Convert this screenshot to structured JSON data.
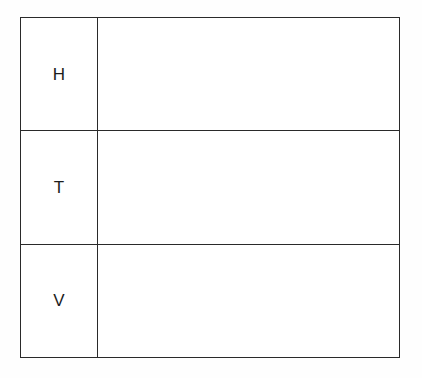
{
  "page": {
    "background_color": "#fefefe",
    "border_color": "#2a2a2a",
    "text_color": "#1c1c1c"
  },
  "table": {
    "rows": [
      {
        "label": "H",
        "content": ""
      },
      {
        "label": "T",
        "content": ""
      },
      {
        "label": "V",
        "content": ""
      }
    ]
  }
}
